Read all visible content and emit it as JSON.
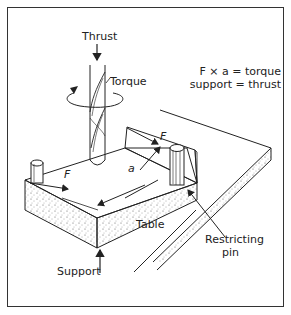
{
  "diagram": {
    "labels": {
      "thrust": "Thrust",
      "torque": "Torque",
      "force_left": "F",
      "force_right": "F",
      "distance": "a",
      "table": "Table",
      "support": "Support",
      "restricting_pin_line1": "Restricting",
      "restricting_pin_line2": "pin"
    },
    "equations": {
      "line1": "F × a = torque",
      "line2": "support = thrust"
    },
    "colors": {
      "line": "#222222",
      "frame": "#333333",
      "background": "#ffffff"
    }
  }
}
